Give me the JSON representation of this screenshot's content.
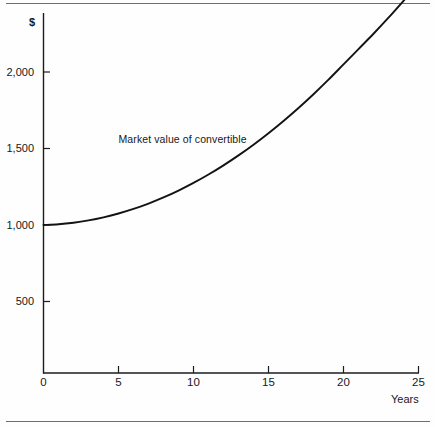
{
  "figure": {
    "background_color": "#fefefe",
    "rule_color": "#6f6f6f",
    "axis_color": "#1b1c1e",
    "curve_color": "#121314"
  },
  "chart_data": {
    "type": "line",
    "title": "",
    "subtitle": "",
    "xlabel": "Years",
    "ylabel": "$",
    "xlim": [
      0,
      25
    ],
    "ylim": [
      0,
      2350
    ],
    "grid": false,
    "legend": "none",
    "xticks": [
      0,
      5,
      10,
      15,
      20,
      25
    ],
    "xtick_labels": [
      "0",
      "5",
      "10",
      "15",
      "20",
      "25"
    ],
    "yticks": [
      500,
      1000,
      1500,
      2000
    ],
    "ytick_labels": [
      "500",
      "1,000",
      "1,500",
      "2,000"
    ],
    "annotations": [
      {
        "text": "Market value of convertible",
        "x": 5.0,
        "y": 1560
      }
    ],
    "series": [
      {
        "name": "Market value of convertible",
        "x": [
          0,
          1,
          2,
          3,
          4,
          5,
          6,
          7,
          8,
          9,
          10,
          11,
          12,
          13,
          14,
          15,
          16,
          17,
          18,
          19,
          20,
          21,
          22,
          23,
          24,
          24.8
        ],
        "values": [
          1000,
          1005,
          1015,
          1030,
          1050,
          1075,
          1105,
          1140,
          1180,
          1225,
          1275,
          1330,
          1390,
          1455,
          1525,
          1600,
          1680,
          1765,
          1855,
          1950,
          2050,
          2150,
          2250,
          2355,
          2465,
          2555
        ]
      }
    ]
  },
  "axis_labels": {
    "y_unit": "$",
    "x_name": "Years"
  }
}
